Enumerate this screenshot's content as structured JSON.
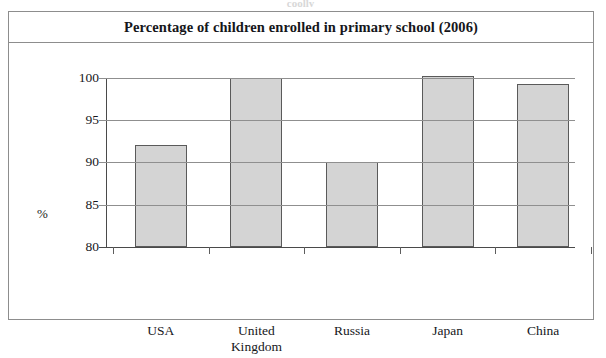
{
  "scan": {
    "top_sliver_text": "coolly"
  },
  "figure": {
    "title": "Percentage of children enrolled in primary school (2006)"
  },
  "chart_data": {
    "type": "bar",
    "title": "Percentage of children enrolled in primary school (2006)",
    "xlabel": "",
    "ylabel": "%",
    "categories": [
      "USA",
      "United Kingdom",
      "Russia",
      "Japan",
      "China"
    ],
    "category_lines": [
      [
        "USA"
      ],
      [
        "United",
        "Kingdom"
      ],
      [
        "Russia"
      ],
      [
        "Japan"
      ],
      [
        "China"
      ]
    ],
    "values": [
      92,
      100,
      90,
      100.2,
      99.3
    ],
    "ylim": [
      80,
      101.5
    ],
    "yticks": [
      80,
      85,
      90,
      95,
      100
    ],
    "ytick_labels": [
      "80",
      "85",
      "90",
      "95",
      "100"
    ],
    "grid": true,
    "legend": false,
    "bar_fill_color": "#d4d4d4",
    "bar_edge_color": "#5a5a5a",
    "axis_color": "#4a4a4a",
    "grid_color": "#8f8f8f"
  }
}
